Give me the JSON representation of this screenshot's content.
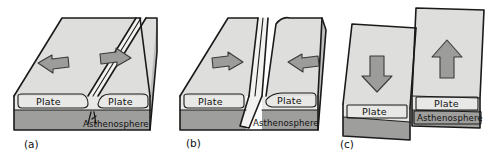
{
  "figure": {
    "background_color": "#ffffff",
    "palette": {
      "plate_top": "#dededc",
      "crust_face": "#e8e8e6",
      "asthenosphere_face": "#9e9e9c",
      "block_side": "#bdbdbb",
      "arrow_fill": "#9c9c9a",
      "outline": "#1a1a1a"
    }
  },
  "panels": [
    {
      "id": "panel-a",
      "caption": "(a)",
      "boundary_type": "divergent",
      "arrows": [
        {
          "name": "arrow-left",
          "direction": "left"
        },
        {
          "name": "arrow-right",
          "direction": "right"
        }
      ],
      "labels": {
        "plate_left": "Plate",
        "plate_right": "Plate",
        "asthenosphere": "Asthenosphere"
      }
    },
    {
      "id": "panel-b",
      "caption": "(b)",
      "boundary_type": "convergent",
      "arrows": [
        {
          "name": "arrow-right",
          "direction": "right"
        },
        {
          "name": "arrow-left",
          "direction": "left"
        }
      ],
      "labels": {
        "plate_left": "Plate",
        "plate_right": "Plate",
        "asthenosphere": "Asthenosphere"
      }
    },
    {
      "id": "panel-c",
      "caption": "(c)",
      "boundary_type": "transform",
      "arrows": [
        {
          "name": "arrow-down",
          "direction": "down"
        },
        {
          "name": "arrow-up",
          "direction": "up"
        }
      ],
      "labels": {
        "plate_left": "Plate",
        "plate_right": "Plate",
        "asthenosphere": "Asthenosphere"
      }
    }
  ]
}
